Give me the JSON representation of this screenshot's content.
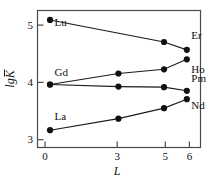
{
  "chart_data": {
    "type": "line",
    "title": "",
    "xlabel": "L",
    "ylabel": "lgK",
    "ylabel_overline": true,
    "xlim": [
      -0.55,
      6.6
    ],
    "ylim": [
      2.72,
      5.33
    ],
    "xticks": [
      0,
      3,
      5,
      6
    ],
    "xticklabels": [
      "0",
      "3",
      "5",
      "6"
    ],
    "yticks": [
      3,
      4,
      5
    ],
    "yticklabels": [
      "3",
      "4",
      "5"
    ],
    "grid": false,
    "legend": "none",
    "marker": "filled-circle",
    "line_color": "#1a1a1a",
    "marker_color": "#111111",
    "axis_color": "#4a4a4a",
    "background": "#ffffff",
    "x": [
      0,
      3,
      5,
      6
    ],
    "series": [
      {
        "name": "Lu-Er",
        "start_label": "Lu",
        "end_label": "Er",
        "values": [
          5.15,
          null,
          4.73,
          4.58
        ],
        "points": [
          {
            "x": 0,
            "y": 5.15
          },
          {
            "x": 5,
            "y": 4.73
          },
          {
            "x": 6,
            "y": 4.58
          }
        ]
      },
      {
        "name": "Gd-Ho",
        "start_label": "Gd",
        "end_label": "Ho",
        "values": [
          3.92,
          4.13,
          4.21,
          4.4
        ],
        "points": [
          {
            "x": 0,
            "y": 3.92
          },
          {
            "x": 3,
            "y": 4.13
          },
          {
            "x": 5,
            "y": 4.21
          },
          {
            "x": 6,
            "y": 4.4
          }
        ]
      },
      {
        "name": "Gd-Pm",
        "start_label": "",
        "end_label": "Pm",
        "values": [
          3.92,
          3.88,
          3.87,
          3.8
        ],
        "points": [
          {
            "x": 0,
            "y": 3.92
          },
          {
            "x": 3,
            "y": 3.88
          },
          {
            "x": 5,
            "y": 3.87
          },
          {
            "x": 6,
            "y": 3.8
          }
        ]
      },
      {
        "name": "La-Nd",
        "start_label": "La",
        "end_label": "Nd",
        "values": [
          3.05,
          3.27,
          3.47,
          3.64
        ],
        "points": [
          {
            "x": 0,
            "y": 3.05
          },
          {
            "x": 3,
            "y": 3.27
          },
          {
            "x": 5,
            "y": 3.47
          },
          {
            "x": 6,
            "y": 3.64
          }
        ]
      }
    ],
    "annotations": [
      {
        "text": "Lu",
        "x": 0,
        "y": 5.03,
        "anchor": "left",
        "name": "label-lu"
      },
      {
        "text": "Er",
        "x": 6,
        "y": 4.78,
        "anchor": "left",
        "name": "label-er"
      },
      {
        "text": "Gd",
        "x": 0,
        "y": 4.08,
        "anchor": "left",
        "name": "label-gd"
      },
      {
        "text": "Ho",
        "x": 6,
        "y": 4.14,
        "anchor": "left",
        "name": "label-ho"
      },
      {
        "text": "Pm",
        "x": 6,
        "y": 3.97,
        "anchor": "left",
        "name": "label-pm"
      },
      {
        "text": "Nd",
        "x": 6,
        "y": 3.46,
        "anchor": "left",
        "name": "label-nd"
      },
      {
        "text": "La",
        "x": 0,
        "y": 3.25,
        "anchor": "left",
        "name": "label-la"
      }
    ]
  },
  "axes": {
    "y_label_text": "lgK",
    "x_label_text": "L",
    "ytick_0": "5",
    "ytick_1": "4",
    "ytick_2": "3",
    "xtick_0": "0",
    "xtick_1": "3",
    "xtick_2": "5",
    "xtick_3": "6"
  }
}
